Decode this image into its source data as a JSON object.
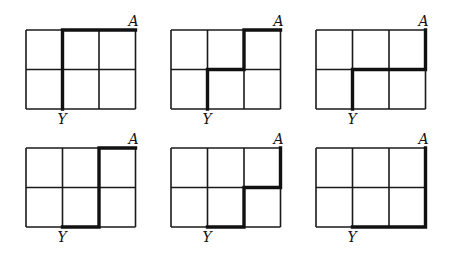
{
  "diagram": {
    "grid": {
      "columns": 3,
      "rows": 2
    },
    "start_label": "Y",
    "end_label": "A",
    "start_node": [
      1,
      2
    ],
    "end_node": [
      3,
      0
    ],
    "panels": [
      {
        "id": 1,
        "path": [
          [
            1,
            2
          ],
          [
            1,
            1
          ],
          [
            1,
            0
          ],
          [
            2,
            0
          ],
          [
            3,
            0
          ]
        ]
      },
      {
        "id": 2,
        "path": [
          [
            1,
            2
          ],
          [
            1,
            1
          ],
          [
            2,
            1
          ],
          [
            2,
            0
          ],
          [
            3,
            0
          ]
        ]
      },
      {
        "id": 3,
        "path": [
          [
            1,
            2
          ],
          [
            1,
            1
          ],
          [
            2,
            1
          ],
          [
            3,
            1
          ],
          [
            3,
            0
          ]
        ]
      },
      {
        "id": 4,
        "path": [
          [
            1,
            2
          ],
          [
            2,
            2
          ],
          [
            2,
            1
          ],
          [
            2,
            0
          ],
          [
            3,
            0
          ]
        ]
      },
      {
        "id": 5,
        "path": [
          [
            1,
            2
          ],
          [
            2,
            2
          ],
          [
            2,
            1
          ],
          [
            3,
            1
          ],
          [
            3,
            0
          ]
        ]
      },
      {
        "id": 6,
        "path": [
          [
            1,
            2
          ],
          [
            2,
            2
          ],
          [
            3,
            2
          ],
          [
            3,
            1
          ],
          [
            3,
            0
          ]
        ]
      }
    ]
  }
}
